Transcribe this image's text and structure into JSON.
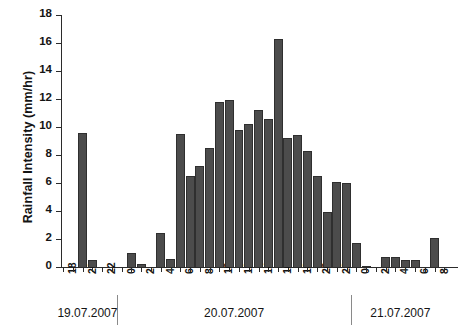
{
  "chart_data": {
    "type": "bar",
    "title": "",
    "subtitle": "",
    "xlabel": "",
    "ylabel": "Rainfall Intensity (mm/hr)",
    "ylim": [
      0,
      18
    ],
    "ytick_step": 2,
    "yticks": [
      0,
      2,
      4,
      6,
      8,
      10,
      12,
      14,
      16,
      18
    ],
    "grid": false,
    "legend": null,
    "bar_color": "#4c4c4c",
    "axis_color": "#2b2b2b",
    "x_tick_interval_hours": 1,
    "x_label_interval_hours": 2,
    "xlabel_unit": "hour of day",
    "categories": [
      "18",
      "19",
      "20",
      "21",
      "22",
      "23",
      "0",
      "1",
      "2",
      "3",
      "4",
      "5",
      "6",
      "7",
      "8",
      "9",
      "10",
      "11",
      "12",
      "13",
      "14",
      "15",
      "16",
      "17",
      "18",
      "19",
      "20",
      "21",
      "22",
      "23",
      "0",
      "1",
      "2",
      "3",
      "4",
      "5",
      "6",
      "7",
      "8",
      "9"
    ],
    "values": [
      0.0,
      0.0,
      9.6,
      0.5,
      0.0,
      0.0,
      0.0,
      1.0,
      0.2,
      0.0,
      2.4,
      0.6,
      9.5,
      6.5,
      7.2,
      8.5,
      11.8,
      11.9,
      9.8,
      10.2,
      11.2,
      10.6,
      16.3,
      9.2,
      9.4,
      8.3,
      6.5,
      3.9,
      6.1,
      6.0,
      1.7,
      0.1,
      0.0,
      0.7,
      0.7,
      0.5,
      0.5,
      0.0,
      2.1,
      0.0
    ],
    "tick_labels_visible": [
      "18",
      "20",
      "22",
      "0",
      "2",
      "4",
      "6",
      "8",
      "10",
      "12",
      "14",
      "16",
      "18",
      "20",
      "22",
      "0",
      "2",
      "4",
      "6",
      "8"
    ],
    "day_groups": [
      {
        "label": "19.07.2007",
        "start_index": 0,
        "end_index": 5
      },
      {
        "label": "20.07.2007",
        "start_index": 6,
        "end_index": 29
      },
      {
        "label": "21.07.2007",
        "start_index": 30,
        "end_index": 39
      }
    ],
    "day_separator_indices": [
      6,
      30
    ]
  }
}
